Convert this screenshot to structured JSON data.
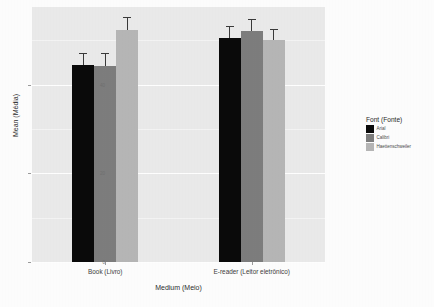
{
  "chart_data": {
    "type": "bar",
    "title": "",
    "xlabel": "Medium (Meio)",
    "ylabel": "Mean (Média)",
    "legend_title": "Font (Fonte)",
    "legend_position": "right",
    "grid": true,
    "ylim": [
      0,
      57.5
    ],
    "yticks": [
      "0",
      "20",
      "40"
    ],
    "ytick_values": [
      0,
      20,
      40
    ],
    "categories": [
      "Book (Livro)",
      "E-reader (Leitor eletrônico)"
    ],
    "series": [
      {
        "name": "Arial",
        "color": "#0a0a0a",
        "values": [
          44.5,
          50.5
        ],
        "errors": [
          2.6,
          2.7
        ]
      },
      {
        "name": "Calibri",
        "color": "#7d7d7d",
        "values": [
          44.2,
          52.0
        ],
        "errors": [
          3.0,
          2.8
        ]
      },
      {
        "name": "Haettenschweiler",
        "color": "#b6b6b6",
        "values": [
          52.3,
          50.0
        ],
        "errors": [
          2.9,
          2.6
        ]
      }
    ]
  },
  "axes": {
    "y_label": "Mean (Média)",
    "x_label": "Medium (Meio)",
    "y_ticks": [
      "40",
      "20",
      "0"
    ],
    "x_ticks": [
      "Book (Livro)",
      "E-reader (Leitor eletrônico)"
    ]
  },
  "legend": {
    "title": "Font (Fonte)",
    "items": [
      {
        "label": "Arial",
        "color": "#0a0a0a"
      },
      {
        "label": "Calibri",
        "color": "#7d7d7d"
      },
      {
        "label": "Haettenschweiler",
        "color": "#b6b6b6"
      }
    ]
  },
  "artifacts": {
    "bleed_a": "ooo",
    "bleed_b": "70",
    "bleed_c": "oca",
    "bleed_d": "au"
  },
  "colors": {
    "panel_background": "#eaeaea",
    "page_background": "#fdfdfd",
    "gridline": "#ffffff",
    "axis_text": "#3b3b3b"
  }
}
